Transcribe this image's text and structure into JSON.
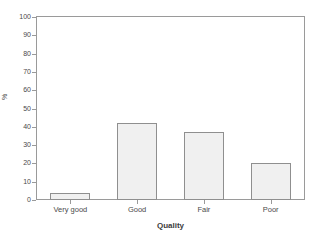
{
  "chart_data": {
    "type": "bar",
    "title": "",
    "categories": [
      "Very good",
      "Good",
      "Fair",
      "Poor"
    ],
    "values": [
      4,
      42,
      37,
      20
    ],
    "xlabel": "Quality",
    "ylabel": "%",
    "ylim": [
      0,
      100
    ],
    "y_ticks": [
      0,
      10,
      20,
      30,
      40,
      50,
      60,
      70,
      80,
      90,
      100
    ],
    "y_tick_labels": [
      "0",
      "10",
      "20",
      "30",
      "40",
      "50",
      "60",
      "70",
      "80",
      "90",
      "100"
    ],
    "grid": false,
    "legend": false,
    "legend_position": "none",
    "series": [
      {
        "name": "Percent",
        "values": [
          4,
          42,
          37,
          20
        ]
      }
    ],
    "colors": {
      "bar_fill": "#f0f0f0",
      "bar_border": "#8f8f8f",
      "axis": "#9a9a9a",
      "text": "#4a4a4a",
      "background": "#ffffff"
    }
  },
  "header": {
    "remnant_text": ""
  }
}
